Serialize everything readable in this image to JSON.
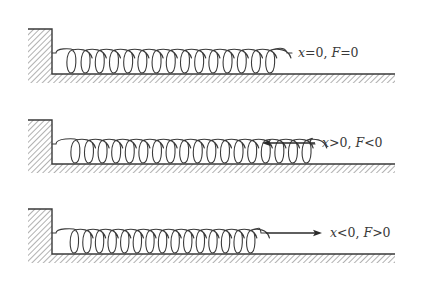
{
  "colors": {
    "stroke": "#3a3a3a",
    "hatch": "#6a6a6a",
    "background": "#ffffff"
  },
  "panels": [
    {
      "id": "equilibrium",
      "wall": {
        "x": 28,
        "y_top": 29,
        "width": 24
      },
      "floor_y": 74,
      "floor_end_x": 395,
      "spring": {
        "start_x": 52,
        "hook_y": 53,
        "first_coil_x": 72,
        "coil_count": 15,
        "pitch": 14.2,
        "coil_rx": 8.5,
        "end_hook_x": 292
      },
      "arrow": null,
      "label": {
        "x_var": "x",
        "x_rel": "=0,",
        "f_var": "F",
        "f_rel": "=0",
        "left": 298,
        "top": 47
      },
      "caption": "x=0, F=0"
    },
    {
      "id": "stretched",
      "wall": {
        "x": 28,
        "y_top": 120,
        "width": 24
      },
      "floor_y": 164,
      "floor_end_x": 395,
      "spring": {
        "start_x": 52,
        "hook_y": 144,
        "first_coil_x": 76,
        "coil_count": 18,
        "pitch": 13.6,
        "coil_rx": 8.5,
        "end_hook_x": 315
      },
      "arrow": {
        "from_x": 315,
        "to_x": 262,
        "y": 143,
        "direction": "left"
      },
      "label": {
        "x_var": "x",
        "x_rel": ">0,",
        "f_var": "F",
        "f_rel": "<0",
        "left": 322,
        "top": 137
      },
      "caption": "x>0, F<0"
    },
    {
      "id": "compressed",
      "wall": {
        "x": 28,
        "y_top": 209,
        "width": 24
      },
      "floor_y": 254,
      "floor_end_x": 395,
      "spring": {
        "start_x": 52,
        "hook_y": 233,
        "first_coil_x": 75,
        "coil_count": 15,
        "pitch": 12.6,
        "coil_rx": 7.8,
        "end_hook_x": 266
      },
      "arrow": {
        "from_x": 266,
        "to_x": 322,
        "y": 233,
        "direction": "right"
      },
      "label": {
        "x_var": "x",
        "x_rel": "<0,",
        "f_var": "F",
        "f_rel": ">0",
        "left": 330,
        "top": 227
      },
      "caption": "x<0, F>0"
    }
  ]
}
